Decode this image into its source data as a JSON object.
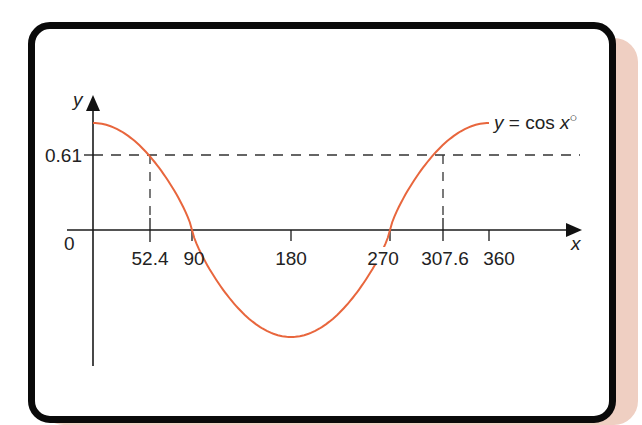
{
  "figure": {
    "curve_label": "y = cos x°",
    "y_axis_label": "y",
    "x_axis_label": "x",
    "origin_label": "0",
    "y_marker_label": "0.61",
    "x_tick_labels": [
      "52.4",
      "90",
      "180",
      "270",
      "307.6",
      "360"
    ],
    "colors": {
      "curve": "#e8663d",
      "axes": "#1a1a1a",
      "border": "#0a0a0a",
      "shadow": "#efcfc2",
      "dashed": "#333333"
    }
  },
  "chart_data": {
    "type": "line",
    "title": "",
    "series": [
      {
        "name": "y = cos x°",
        "x": [
          0,
          30,
          52.4,
          60,
          90,
          120,
          150,
          180,
          210,
          240,
          270,
          300,
          307.6,
          330,
          360
        ],
        "values": [
          1,
          0.866,
          0.61,
          0.5,
          0,
          -0.5,
          -0.866,
          -1,
          -0.866,
          -0.5,
          0,
          0.5,
          0.61,
          0.866,
          1
        ]
      }
    ],
    "xlabel": "x",
    "ylabel": "y",
    "x_ticks": [
      52.4,
      90,
      180,
      270,
      307.6,
      360
    ],
    "y_ticks": [
      0.61
    ],
    "annotations": [
      {
        "type": "hline-dashed",
        "y": 0.61
      },
      {
        "type": "vline-dashed",
        "x": 52.4,
        "from_y": 0,
        "to_y": 0.61
      },
      {
        "type": "vline-dashed",
        "x": 307.6,
        "from_y": 0,
        "to_y": 0.61
      }
    ],
    "xlim": [
      0,
      360
    ],
    "ylim": [
      -1,
      1
    ],
    "grid": false,
    "legend": "inline label at curve end"
  }
}
